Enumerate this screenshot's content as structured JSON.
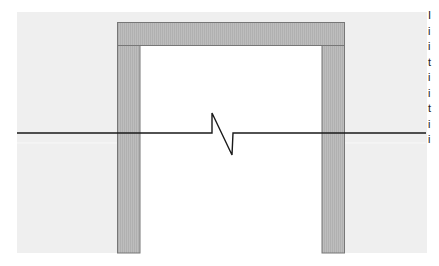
{
  "diagram": {
    "type": "architectural-section-break",
    "colors": {
      "background_region": "#efefef",
      "frame_fill": "#b8b8b8",
      "frame_stroke": "#777777",
      "opening_fill": "#ffffff",
      "break_line": "#1a1a1a"
    },
    "background_region": {
      "x": 17,
      "y": 12,
      "w": 410,
      "h": 241
    },
    "frame": {
      "outer_left": 117,
      "outer_right": 345,
      "top": 22,
      "header_bottom": 45,
      "inner_left": 140,
      "inner_right": 322,
      "bottom": 253
    },
    "break_line": {
      "y": 133,
      "x_start": 17,
      "x_end": 426,
      "zigzag": [
        [
          212,
          133
        ],
        [
          212,
          113
        ],
        [
          232,
          155
        ],
        [
          233,
          133
        ]
      ]
    }
  },
  "side_text": {
    "note": "clipped text column at right edge",
    "lines": [
      "I",
      "i",
      "i",
      "t",
      "i",
      "i",
      "t",
      "i",
      "i"
    ]
  }
}
